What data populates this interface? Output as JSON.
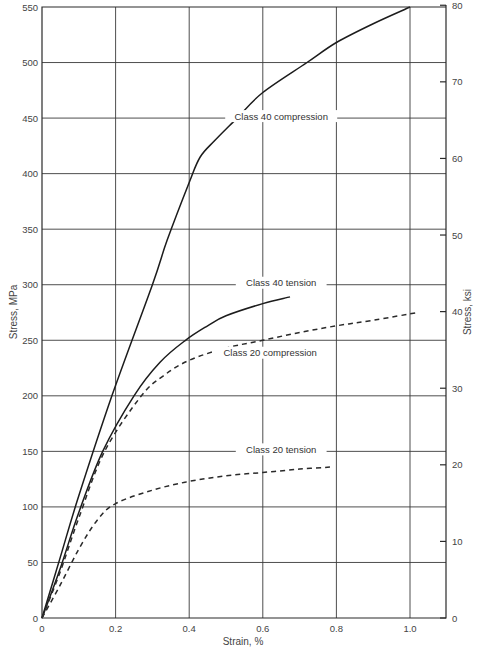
{
  "chart_data": {
    "type": "line",
    "title": "",
    "xlabel": "Strain, %",
    "ylabel": "Stress, MPa",
    "ylabel_right": "Stress, ksi",
    "xlim": [
      0,
      1.1
    ],
    "ylim": [
      0,
      550
    ],
    "ylim_right": [
      0,
      80
    ],
    "x_ticks": [
      "0",
      "0.2",
      "0.4",
      "0.6",
      "0.8",
      "1.0"
    ],
    "x_tick_values": [
      0,
      0.2,
      0.4,
      0.6,
      0.8,
      1.0
    ],
    "y_ticks": [
      "0",
      "50",
      "100",
      "150",
      "200",
      "250",
      "300",
      "350",
      "400",
      "450",
      "500",
      "550"
    ],
    "y_tick_values": [
      0,
      50,
      100,
      150,
      200,
      250,
      300,
      350,
      400,
      450,
      500,
      550
    ],
    "y_right_ticks": [
      "0",
      "10",
      "20",
      "30",
      "40",
      "50",
      "60",
      "70",
      "80"
    ],
    "y_right_tick_values": [
      0,
      10,
      20,
      30,
      40,
      50,
      60,
      70,
      80
    ],
    "grid": true,
    "legend": "inline labels",
    "series": [
      {
        "name": "Class 40 compression",
        "style": "solid",
        "x": [
          0,
          0.05,
          0.1,
          0.19,
          0.3,
          0.34,
          0.4,
          0.43,
          0.47,
          0.53,
          0.6,
          0.72,
          0.8,
          0.9,
          1.0
        ],
        "y": [
          0,
          55,
          110,
          200,
          300,
          340,
          392,
          415,
          430,
          450,
          473,
          500,
          518,
          535,
          550
        ],
        "label_pos": {
          "x": 0.65,
          "y": 450
        }
      },
      {
        "name": "Class 40 tension",
        "style": "solid",
        "x": [
          0,
          0.05,
          0.1,
          0.165,
          0.25,
          0.32,
          0.39,
          0.45,
          0.5,
          0.6,
          0.674
        ],
        "y": [
          0,
          45,
          95,
          150,
          200,
          230,
          250,
          263,
          272,
          283,
          289
        ],
        "label_pos": {
          "x": 0.65,
          "y": 300
        }
      },
      {
        "name": "Class 20 compression",
        "style": "dashed",
        "x": [
          0,
          0.05,
          0.1,
          0.17,
          0.27,
          0.33,
          0.4,
          0.5,
          0.6,
          0.7,
          0.8,
          0.9,
          1.02
        ],
        "y": [
          0,
          42,
          90,
          150,
          200,
          218,
          232,
          243,
          250,
          257,
          263,
          268,
          275
        ],
        "label_pos": {
          "x": 0.62,
          "y": 237
        }
      },
      {
        "name": "Class 20 tension",
        "style": "dashed",
        "x": [
          0,
          0.05,
          0.1,
          0.15,
          0.2,
          0.3,
          0.4,
          0.5,
          0.6,
          0.7,
          0.79
        ],
        "y": [
          0,
          30,
          62,
          88,
          103,
          115,
          123,
          128,
          131,
          134,
          136
        ],
        "label_pos": {
          "x": 0.65,
          "y": 150
        }
      }
    ]
  }
}
